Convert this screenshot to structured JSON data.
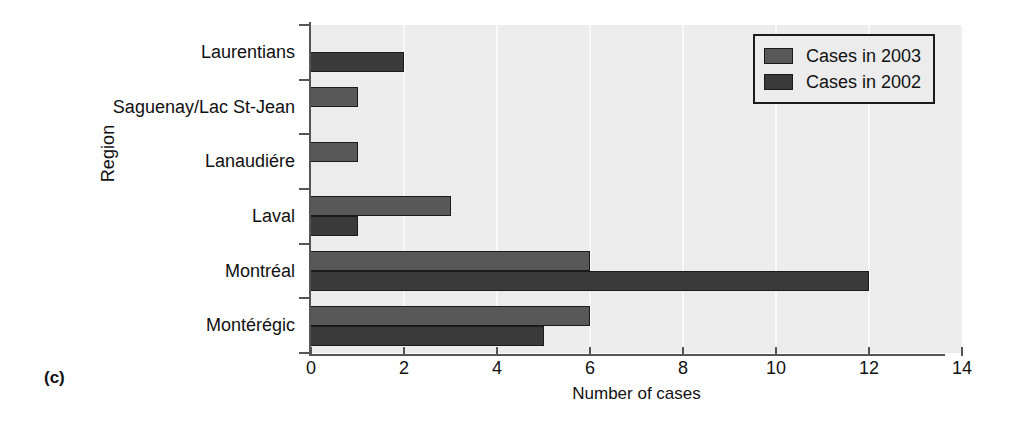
{
  "panel": {
    "label": "(c)"
  },
  "chart_data": {
    "type": "bar",
    "orientation": "horizontal",
    "title": "",
    "xlabel": "Number of cases",
    "ylabel": "Region",
    "categories": [
      "Laurentians",
      "Saguenay/Lac St-Jean",
      "Lanaudiére",
      "Laval",
      "Montréal",
      "Montérégic"
    ],
    "series": [
      {
        "name": "Cases in 2003",
        "color": "#585858",
        "values": [
          0,
          1,
          1,
          3,
          6,
          6
        ]
      },
      {
        "name": "Cases in 2002",
        "color": "#3a3a3a",
        "values": [
          2,
          0,
          0,
          1,
          12,
          5
        ]
      }
    ],
    "xlim": [
      0,
      14
    ],
    "xticks": [
      0,
      2,
      4,
      6,
      8,
      10,
      12,
      14
    ],
    "xtick_labels": [
      "0",
      "2",
      "4",
      "6",
      "8",
      "10",
      "12",
      "14"
    ],
    "grid": "vertical-white",
    "legend_position": "top-right",
    "plot_background": "#ececec"
  }
}
